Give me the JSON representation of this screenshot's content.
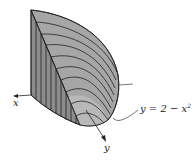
{
  "figure": {
    "colors": {
      "fill_side": "#8a8a8a",
      "fill_top": "#a8a8a8",
      "fill_front": "#b4b4b4",
      "stroke": "#222222"
    }
  },
  "labels": {
    "x_axis": "x",
    "y_axis": "y",
    "curve_eq_main": "y = 2 − x",
    "curve_eq_exp": "2"
  }
}
